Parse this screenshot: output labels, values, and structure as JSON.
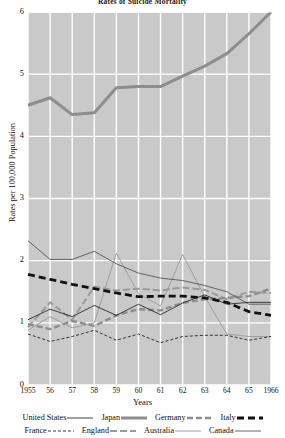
{
  "chart_data": {
    "type": "line",
    "title": "Rates of Suicide Mortality",
    "xlabel": "Years",
    "ylabel": "Rates per 100,000 Population",
    "categories": [
      "1955",
      "56",
      "57",
      "58",
      "59",
      "60",
      "61",
      "62",
      "63",
      "64",
      "65",
      "1966"
    ],
    "x_tick_labels": [
      "1955",
      "56",
      "57",
      "58",
      "59",
      "60",
      "61",
      "62",
      "63",
      "64",
      "65",
      "1966"
    ],
    "y_tick_labels": [
      "0",
      "1",
      "2",
      "3",
      "4",
      "5",
      "6"
    ],
    "ylim": [
      0,
      6
    ],
    "xlim": [
      1955,
      1966
    ],
    "grid": true,
    "legend_position": "below",
    "plot_background": "#c9c9c9",
    "grid_color": "#ffffff",
    "series": [
      {
        "name": "United States",
        "style": "solid-thin",
        "color": "#2a2a2a",
        "values": [
          1.05,
          1.22,
          1.1,
          1.28,
          1.12,
          1.3,
          1.13,
          1.32,
          1.45,
          1.3,
          1.33,
          1.33
        ]
      },
      {
        "name": "Japan",
        "style": "solid-thick-gray",
        "color": "#8d8d8d",
        "values": [
          4.5,
          4.62,
          4.35,
          4.38,
          4.78,
          4.8,
          4.8,
          4.97,
          5.13,
          5.33,
          5.65,
          6.0
        ]
      },
      {
        "name": "Germany",
        "style": "dashed-medium-gray",
        "color": "#8d8d8d",
        "values": [
          0.98,
          0.9,
          1.03,
          0.95,
          1.12,
          1.22,
          1.2,
          1.32,
          1.38,
          1.4,
          1.43,
          1.55
        ]
      },
      {
        "name": "Italy",
        "style": "dashed-thick-black",
        "color": "#111111",
        "values": [
          1.78,
          1.7,
          1.62,
          1.55,
          1.48,
          1.42,
          1.43,
          1.43,
          1.4,
          1.33,
          1.18,
          1.12
        ]
      },
      {
        "name": "France",
        "style": "dashed-thin-black",
        "color": "#222222",
        "values": [
          0.82,
          0.7,
          0.78,
          0.88,
          0.72,
          0.82,
          0.68,
          0.78,
          0.8,
          0.8,
          0.72,
          0.78
        ]
      },
      {
        "name": "England",
        "style": "dashed-long-gray",
        "color": "#9a9a9a",
        "values": [
          0.93,
          1.33,
          1.05,
          1.58,
          1.52,
          1.55,
          1.52,
          1.57,
          1.53,
          1.38,
          1.5,
          1.48
        ]
      },
      {
        "name": "Australia",
        "style": "solid-medium-gray",
        "color": "#a0a0a0",
        "values": [
          0.88,
          1.1,
          0.92,
          1.0,
          2.12,
          1.47,
          1.27,
          2.1,
          1.42,
          0.82,
          0.78,
          0.78
        ]
      },
      {
        "name": "Canada",
        "style": "solid-thin-dark",
        "color": "#555555",
        "values": [
          2.32,
          2.02,
          2.02,
          2.15,
          1.95,
          1.8,
          1.72,
          1.68,
          1.6,
          1.5,
          1.3,
          1.3
        ]
      }
    ]
  },
  "legend": {
    "row1": [
      {
        "label": "United States",
        "key": "United States"
      },
      {
        "label": "Japan",
        "key": "Japan"
      },
      {
        "label": "Germany",
        "key": "Germany"
      },
      {
        "label": "Italy",
        "key": "Italy"
      }
    ],
    "row2": [
      {
        "label": "France",
        "key": "France"
      },
      {
        "label": "England",
        "key": "England"
      },
      {
        "label": "Australia",
        "key": "Australia"
      },
      {
        "label": "Canada",
        "key": "Canada"
      }
    ]
  }
}
